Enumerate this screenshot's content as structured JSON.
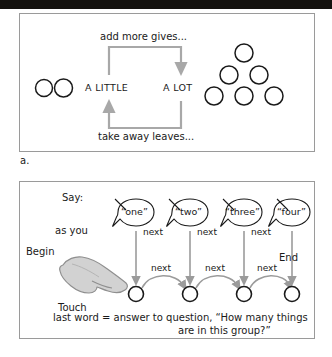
{
  "figure": {
    "label": "a.",
    "panel_a": {
      "name": "more-and-less-relationship-diagram",
      "left_group": {
        "dot_count": 2,
        "quantity_label": "A LITTLE"
      },
      "right_group": {
        "dot_count": 6,
        "quantity_label": "A LOT"
      },
      "top_bracket_label": "add more gives...",
      "bottom_bracket_label": "take away leaves...",
      "bracket_color": "#a8a8a8",
      "dot_stroke": "#1a1a1a"
    },
    "panel_b": {
      "name": "counting-sequence-diagram",
      "say_label": "Say:",
      "as_you_label": "as you",
      "touch_label": "Touch",
      "begin_label": "Begin",
      "end_label": "End",
      "spoken_words": [
        "“one”",
        "“two”",
        "“three”",
        "“four”"
      ],
      "next_labels_upper": [
        "next",
        "next",
        "next"
      ],
      "next_labels_lower": [
        "next",
        "next",
        "next"
      ],
      "object_count": 4,
      "caption_line_1": "last word = answer to question, “How many things",
      "caption_line_2": "are in this group?”",
      "arrow_color": "#9b9b9b",
      "hand_fill": "#d2d2d2",
      "hand_stroke": "#8f8f8f"
    }
  }
}
